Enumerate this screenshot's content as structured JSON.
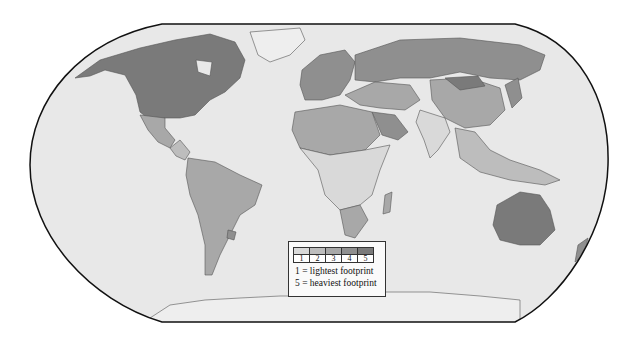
{
  "map": {
    "title": "",
    "projection": "Robinson-style world map",
    "ocean_color": "#e6e6e6",
    "land_default_color": "#eeeeee",
    "border_color": "#555555"
  },
  "legend": {
    "classes": [
      {
        "label": "1",
        "color": "#d9d9d9"
      },
      {
        "label": "2",
        "color": "#bdbdbd"
      },
      {
        "label": "3",
        "color": "#a8a8a8"
      },
      {
        "label": "4",
        "color": "#8f8f8f"
      },
      {
        "label": "5",
        "color": "#7a7a7a"
      }
    ],
    "line1": "1 = lightest footprint",
    "line2": "5 =  heaviest footprint"
  },
  "regions": [
    {
      "name": "North America (USA/Canada)",
      "class": 5
    },
    {
      "name": "Greenland",
      "class": 0
    },
    {
      "name": "Mexico",
      "class": 3
    },
    {
      "name": "Central America",
      "class": 2
    },
    {
      "name": "South America",
      "class": 3
    },
    {
      "name": "Uruguay",
      "class": 4
    },
    {
      "name": "Europe",
      "class": 4
    },
    {
      "name": "Russia",
      "class": 4
    },
    {
      "name": "Mongolia",
      "class": 5
    },
    {
      "name": "China",
      "class": 3
    },
    {
      "name": "India",
      "class": 1
    },
    {
      "name": "Middle East",
      "class": 3
    },
    {
      "name": "Saudi Arabia",
      "class": 4
    },
    {
      "name": "North Africa",
      "class": 3
    },
    {
      "name": "Central Africa",
      "class": 1
    },
    {
      "name": "Southern Africa",
      "class": 3
    },
    {
      "name": "Southeast Asia",
      "class": 2
    },
    {
      "name": "Japan/Korea",
      "class": 4
    },
    {
      "name": "Australia",
      "class": 5
    },
    {
      "name": "New Zealand",
      "class": 4
    },
    {
      "name": "Antarctica",
      "class": 0
    }
  ]
}
